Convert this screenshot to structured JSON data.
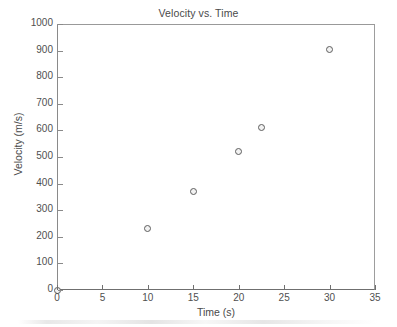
{
  "chart_data": {
    "type": "scatter",
    "title": "Velocity vs. Time",
    "xlabel": "Time (s)",
    "ylabel": "Velocity (m/s)",
    "xlim": [
      0,
      35
    ],
    "ylim": [
      0,
      1000
    ],
    "xticks": [
      0,
      5,
      10,
      15,
      20,
      25,
      30,
      35
    ],
    "yticks": [
      0,
      100,
      200,
      300,
      400,
      500,
      600,
      700,
      800,
      900,
      1000
    ],
    "xticklabels": [
      "0",
      "5",
      "10",
      "15",
      "20",
      "25",
      "30",
      "35"
    ],
    "yticklabels": [
      "0",
      "100",
      "200",
      "300",
      "400",
      "500",
      "600",
      "700",
      "800",
      "900",
      "1000"
    ],
    "grid": false,
    "legend": null,
    "marker": "open-circle",
    "marker_color": "#5d5d5d",
    "points": [
      {
        "x": 0,
        "y": 0
      },
      {
        "x": 10,
        "y": 230
      },
      {
        "x": 15,
        "y": 370
      },
      {
        "x": 20,
        "y": 520
      },
      {
        "x": 22.5,
        "y": 610
      },
      {
        "x": 30,
        "y": 905
      }
    ],
    "series": [
      {
        "name": "Velocity",
        "x": [
          0,
          10,
          15,
          20,
          22.5,
          30
        ],
        "values": [
          0,
          230,
          370,
          520,
          610,
          905
        ]
      }
    ]
  },
  "colors": {
    "axis": "#6f6f6f",
    "text": "#4a4a4a",
    "background": "#ffffff",
    "marker_edge": "#5d5d5d",
    "marker_face": "#f2f2f2"
  }
}
